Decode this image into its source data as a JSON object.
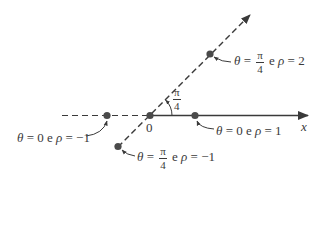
{
  "diagram": {
    "axis_label": "x",
    "origin_label": "0",
    "angle_label": {
      "num": "π",
      "den": "4"
    },
    "colors": {
      "ink": "#3a3a3a",
      "point": "#4a4a4a"
    },
    "points": [
      {
        "id": "p1",
        "theta_sym": "θ",
        "theta": "0",
        "conj": "e",
        "rho_sym": "ρ",
        "rho": "−1",
        "label": "θ = 0 e ρ = −1"
      },
      {
        "id": "p2",
        "theta_sym": "θ",
        "theta": "0",
        "conj": "e",
        "rho_sym": "ρ",
        "rho": "1",
        "label": "θ = 0 e ρ = 1"
      },
      {
        "id": "p3",
        "theta_sym": "θ",
        "theta_num": "π",
        "theta_den": "4",
        "conj": "e",
        "rho_sym": "ρ",
        "rho": "2",
        "label": "θ = π/4 e ρ = 2"
      },
      {
        "id": "p4",
        "theta_sym": "θ",
        "theta_num": "π",
        "theta_den": "4",
        "conj": "e",
        "rho_sym": "ρ",
        "rho": "−1",
        "label": "θ = π/4 e ρ = −1"
      }
    ]
  }
}
